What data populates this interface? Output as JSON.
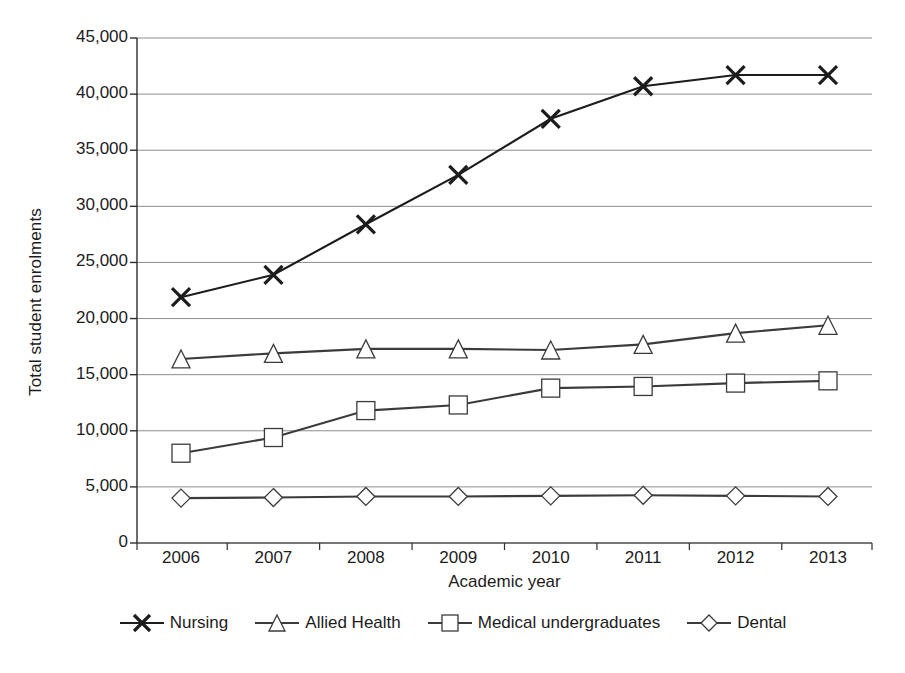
{
  "chart_data": {
    "type": "line",
    "title": "",
    "xlabel": "Academic year",
    "ylabel": "Total student enrolments",
    "categories": [
      "2006",
      "2007",
      "2008",
      "2009",
      "2010",
      "2011",
      "2012",
      "2013"
    ],
    "x": [
      2006,
      2007,
      2008,
      2009,
      2010,
      2011,
      2012,
      2013
    ],
    "ylim": [
      0,
      45000
    ],
    "yticks": [
      0,
      5000,
      10000,
      15000,
      20000,
      25000,
      30000,
      35000,
      40000,
      45000
    ],
    "ytick_labels": [
      "0",
      "5,000",
      "10,000",
      "15,000",
      "20,000",
      "25,000",
      "30,000",
      "35,000",
      "40,000",
      "45,000"
    ],
    "grid": "horizontal",
    "legend_position": "bottom",
    "series": [
      {
        "name": "Nursing",
        "marker": "x",
        "color": "#1c1c1c",
        "values": [
          21900,
          23900,
          28400,
          32800,
          37800,
          40700,
          41700,
          41700
        ]
      },
      {
        "name": "Allied Health",
        "marker": "triangle",
        "color": "#3b3b3b",
        "values": [
          16400,
          16900,
          17300,
          17300,
          17200,
          17700,
          18700,
          19400
        ]
      },
      {
        "name": "Medical undergraduates",
        "marker": "square",
        "color": "#3b3b3b",
        "values": [
          8000,
          9400,
          11800,
          12300,
          13800,
          13950,
          14250,
          14450
        ]
      },
      {
        "name": "Dental",
        "marker": "diamond",
        "color": "#3b3b3b",
        "values": [
          4000,
          4050,
          4150,
          4150,
          4200,
          4250,
          4200,
          4150
        ]
      }
    ]
  },
  "axis": {
    "y_title": "Total student enrolments",
    "x_title": "Academic year"
  },
  "legend": {
    "items": [
      {
        "label": "Nursing"
      },
      {
        "label": "Allied Health"
      },
      {
        "label": "Medical undergraduates"
      },
      {
        "label": "Dental"
      }
    ]
  }
}
